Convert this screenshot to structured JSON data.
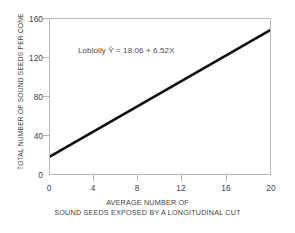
{
  "chart_data": {
    "type": "line",
    "title": "",
    "subtitle": "",
    "xlabel_line1": "AVERAGE NUMBER OF",
    "xlabel_line2": "SOUND SEEDS EXPOSED BY A LONGITUDINAL CUT",
    "ylabel": "TOTAL NUMBER OF SOUND SEEDS PER CONE",
    "xlim": [
      0,
      20
    ],
    "ylim": [
      0,
      160
    ],
    "xticks": [
      0,
      4,
      8,
      12,
      16,
      20
    ],
    "xtick_labels": [
      "0",
      "4",
      "8",
      "12",
      "16",
      "20"
    ],
    "yticks": [
      0,
      40,
      80,
      120,
      160
    ],
    "ytick_labels": [
      "0",
      "40",
      "80",
      "120",
      "160"
    ],
    "grid": false,
    "legend": false,
    "annotations": [
      {
        "text": "Loblolly Ŷ = 18.06 + 6.52X",
        "x": 3.0,
        "y": 128
      }
    ],
    "series": [
      {
        "name": "Loblolly regression",
        "type": "line",
        "equation": "Ŷ = 18.06 + 6.52X",
        "intercept": 18.06,
        "slope": 6.52,
        "color": "#111111",
        "linewidth": 2.6,
        "x": [
          0,
          20
        ],
        "values": [
          18.06,
          148.46
        ]
      }
    ],
    "colors": {
      "line": "#111111",
      "frame": "#b9b9b9",
      "text": "#3f3f3f",
      "background": "#ffffff"
    }
  },
  "axis": {
    "y_title": "TOTAL NUMBER OF SOUND SEEDS PER CONE",
    "x_title_line1": "AVERAGE NUMBER OF",
    "x_title_line2": "SOUND SEEDS EXPOSED BY A LONGITUDINAL CUT",
    "y_labels": [
      "160",
      "120",
      "80",
      "40",
      "0"
    ],
    "x_labels": [
      "0",
      "4",
      "8",
      "12",
      "16",
      "20"
    ]
  },
  "annotation": {
    "text": "Loblolly Ŷ = 18.06 + 6.52X"
  }
}
